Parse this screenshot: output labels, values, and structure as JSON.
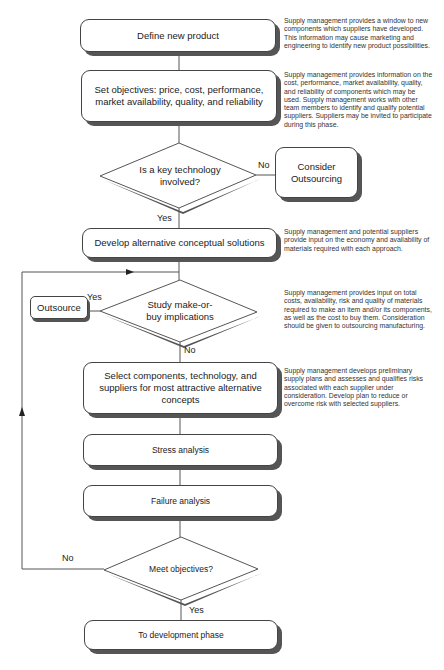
{
  "flowchart": {
    "steps": {
      "define": "Define new product",
      "objectives": "Set objectives: price, cost, performance, market availability, quality, and reliability",
      "key_tech": "Is a key technology involved?",
      "consider_outsourcing": "Consider Outsourcing",
      "develop": "Develop alternative conceptual solutions",
      "make_or_buy": "Study make-or-buy implications",
      "outsource": "Outsource",
      "select": "Select components, technology, and suppliers for most attractive alternative concepts",
      "stress": "Stress analysis",
      "failure": "Failure analysis",
      "meet": "Meet objectives?",
      "to_dev": "To development phase"
    },
    "labels": {
      "no1": "No",
      "yes1": "Yes",
      "yes2": "Yes",
      "no2": "No",
      "no3": "No",
      "yes3": "Yes"
    },
    "notes": {
      "define": "Supply management provides a window to new components which suppliers have developed.  This information may cause marketing and engineering to identify new product possibilities.",
      "objectives": "Supply management provides information on the cost, performance, market availability, quality, and reliability of components which may be used.  Supply management works with other team members to identify and qualify potential suppliers. Suppliers may be invited to participate during this phase.",
      "develop": "Supply management and potential suppliers provide input on the economy and availability of materials required with each approach.",
      "make_or_buy": "Supply management provides input on total costs, availability, risk and quality of materials required to make an item and/or its components, as well as the cost to buy them.  Consideration should be given to outsourcing manufacturing.",
      "select": "Supply management develops preliminary supply plans and assesses and qualifies risks associated with each supplier under consideration. Develop plan to reduce or overcome risk with selected suppliers."
    }
  }
}
